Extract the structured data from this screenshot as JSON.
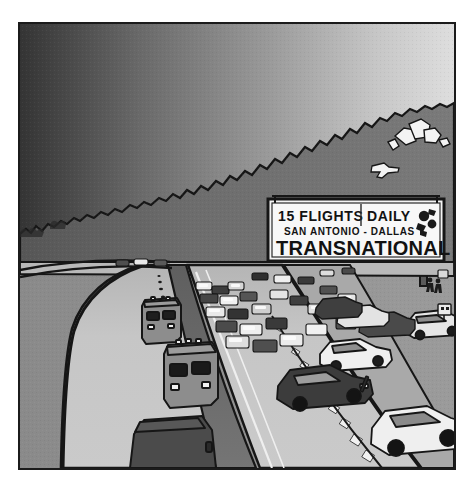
{
  "image": {
    "title": "Freeway traffic jam with airline billboard",
    "style": "grayscale comic illustration",
    "frame": {
      "border_color": "#1b1b1b",
      "x": 18,
      "y": 22,
      "width": 434,
      "height": 444
    }
  },
  "billboard": {
    "name": "transnational-billboard",
    "line1": "15 FLIGHTS DAILY",
    "line1_left": "15 FLIGHTS",
    "line1_right": "DAILY",
    "line2": "SAN ANTONIO - DALLAS",
    "line3": "TRANSNATIONAL",
    "panel_color": "#f4f4f4",
    "text_color": "#121212",
    "frame_color": "#1b1b1b",
    "logo": "bird-logo"
  },
  "scene": {
    "sky_left_color": "#3a3a3a",
    "sky_right_color": "#dcdcdc",
    "hill_color": "#6e6e6e",
    "ground_color": "#8e8e8e",
    "road_color": "#c6c6c6",
    "median_color": "#6a6a6a",
    "shoulder_color": "#9b9b9b",
    "outline_color": "#161616",
    "lane_dash_color": "#1a1a1a",
    "guardrail_color": "#f2f2f2"
  },
  "elements": {
    "airplane": "small-airplane",
    "buildings": "hilltop-buildings",
    "buses": [
      {
        "label": "bus-far",
        "color": "#8d8d8d"
      },
      {
        "label": "bus-mid",
        "color": "#8d8d8d"
      },
      {
        "label": "bus-near",
        "color": "#4b4b4b"
      }
    ],
    "traffic": "congested-cars",
    "pedestrians": "roadside-figures"
  },
  "caption": {
    "alt": "A jammed freeway under a gradient sky; a billboard advertises 15 flights daily between San Antonio and Dallas on Transnational."
  }
}
